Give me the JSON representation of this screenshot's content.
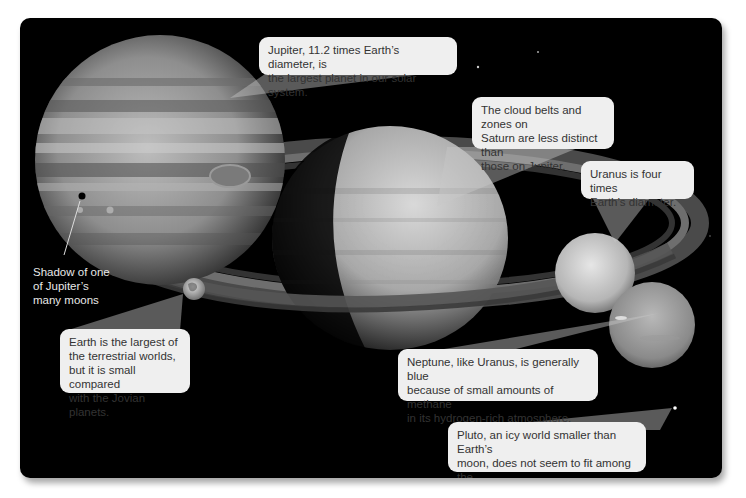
{
  "figure": {
    "type": "solar-system-jovian-planets-comparison",
    "colors": {
      "panel_background": "#000000",
      "page_background": "#ffffff",
      "callout_fill": "#efefef",
      "callout_text": "#333333",
      "pointer_fill": "rgba(200,200,200,0.45)",
      "label_text": "#e8e8e8"
    },
    "bodies": [
      {
        "name": "Jupiter",
        "icon": "jupiter-planet-icon"
      },
      {
        "name": "Saturn",
        "icon": "saturn-planet-icon"
      },
      {
        "name": "Uranus",
        "icon": "uranus-planet-icon"
      },
      {
        "name": "Neptune",
        "icon": "neptune-planet-icon"
      },
      {
        "name": "Earth",
        "icon": "earth-planet-icon"
      },
      {
        "name": "Pluto",
        "icon": "pluto-dot-icon"
      }
    ],
    "callouts": {
      "jupiter": {
        "lines": [
          "Jupiter, 11.2 times Earth’s diameter, is",
          "the largest planet in our solar system."
        ]
      },
      "saturn": {
        "lines": [
          "The cloud belts and zones on",
          "Saturn are less distinct than",
          "those on Jupiter."
        ]
      },
      "uranus": {
        "lines": [
          "Uranus is four times",
          "Earth’s diameter."
        ]
      },
      "earth": {
        "lines": [
          "Earth is the largest of",
          "the terrestrial worlds,",
          "but it is small compared",
          "with the Jovian planets."
        ]
      },
      "neptune": {
        "lines": [
          "Neptune, like Uranus, is generally blue",
          "because of small amounts of methane",
          "in its hydrogen-rich atmosphere."
        ]
      },
      "pluto": {
        "lines": [
          "Pluto, an icy world smaller than Earth’s",
          "moon, does not seem to fit among the",
          "planets of the outer solar system."
        ]
      }
    },
    "labels": {
      "moon_shadow": {
        "lines": [
          "Shadow of one",
          "of Jupiter’s",
          "many moons"
        ]
      }
    }
  }
}
